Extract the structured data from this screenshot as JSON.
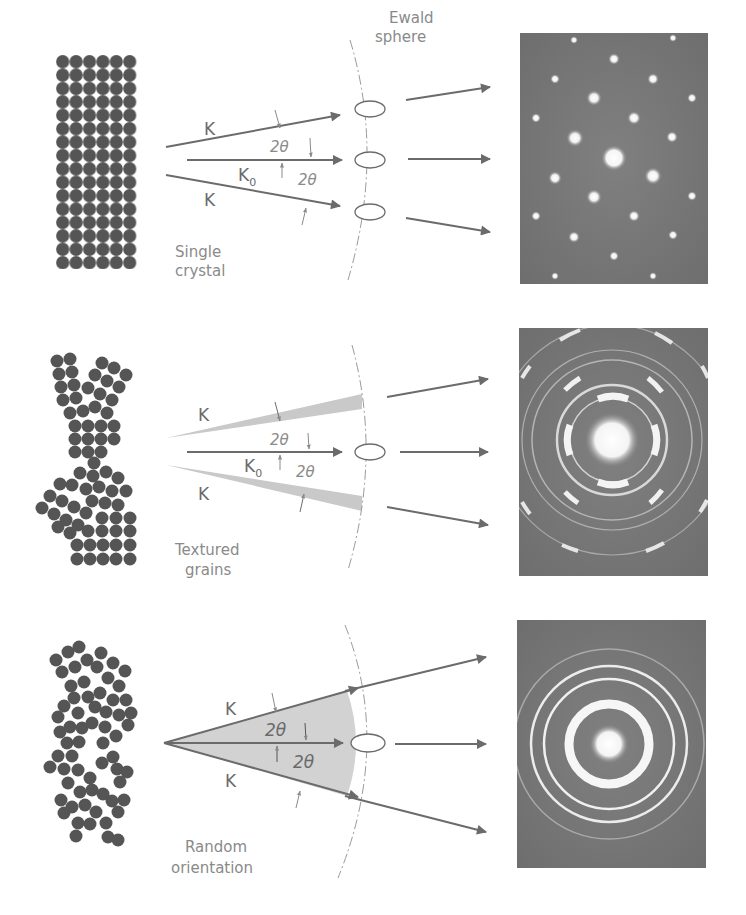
{
  "figure": {
    "ewald_label_line1": "Ewald",
    "ewald_label_line2": "sphere",
    "colors": {
      "atom": "#555555",
      "beam": "#6b6b6b",
      "pattern_bg": "#7a7a7a",
      "shade": "#cfcfcf",
      "text": "#8a8a8a"
    },
    "panels": [
      {
        "id": "single-crystal",
        "caption_line1": "Single",
        "caption_line2": "crystal",
        "k_upper": "K",
        "k_lower": "K",
        "k0": "K",
        "k0_sub": "0",
        "angle_upper": "2θ",
        "angle_lower": "2θ",
        "pattern": "spot pattern"
      },
      {
        "id": "textured-grains",
        "caption_line1": "Textured",
        "caption_line2": "grains",
        "k_upper": "K",
        "k_lower": "K",
        "k0": "K",
        "k0_sub": "0",
        "angle_upper": "2θ",
        "angle_lower": "2θ",
        "pattern": "arced ring pattern"
      },
      {
        "id": "random-orientation",
        "caption_line1": "Random",
        "caption_line2": "orientation",
        "k_upper": "K",
        "k_lower": "K",
        "angle_upper": "2θ",
        "angle_lower": "2θ",
        "pattern": "continuous ring pattern"
      }
    ]
  }
}
